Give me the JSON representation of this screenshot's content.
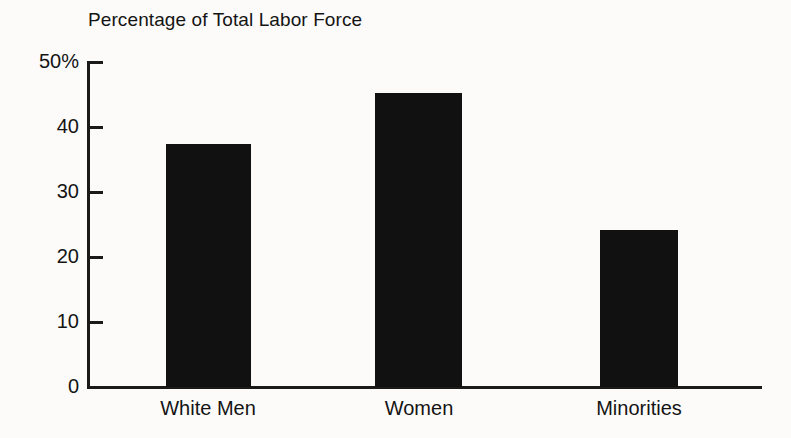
{
  "chart_data": {
    "type": "bar",
    "title": "Percentage of Total Labor Force",
    "xlabel": "",
    "ylabel": "",
    "categories": [
      "White Men",
      "Women",
      "Minorities"
    ],
    "values": [
      37.4,
      45.2,
      24.2
    ],
    "ylim": [
      0,
      50
    ],
    "yticks": [
      0,
      10,
      20,
      30,
      40,
      50
    ],
    "ytick_labels": [
      "0",
      "10",
      "20",
      "30",
      "40",
      "50%"
    ],
    "grid": false,
    "legend": null,
    "bar_color": "#111111",
    "axis_color": "#1a1a1a",
    "background_color": "#fcfbfa"
  }
}
